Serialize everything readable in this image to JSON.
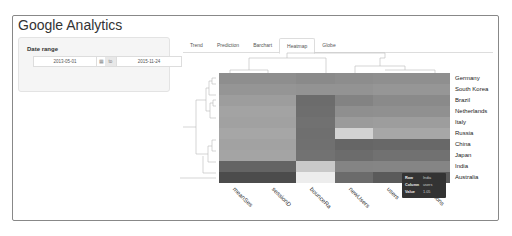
{
  "app": {
    "title": "Google Analytics"
  },
  "sidebar": {
    "date_range_label": "Date range",
    "start_date": "2013-05-01",
    "separator": "to",
    "end_date": "2015-11-24",
    "calendar_icon": "calendar-icon"
  },
  "tabs": [
    {
      "label": "Trend",
      "active": false
    },
    {
      "label": "Prediction",
      "active": false
    },
    {
      "label": "Barchart",
      "active": false
    },
    {
      "label": "Heatmap",
      "active": true
    },
    {
      "label": "Globe",
      "active": false
    }
  ],
  "heatmap": {
    "rows": [
      "Germany",
      "South Korea",
      "Brazil",
      "Netherlands",
      "Italy",
      "Russia",
      "China",
      "Japan",
      "India",
      "Australia"
    ],
    "columns": [
      "meanSessionDuration",
      "sessionDuration",
      "bounceRate",
      "newUsers",
      "users",
      "sessions"
    ],
    "column_labels_visible": [
      "meanSes",
      "sessionD",
      "bounceRa",
      "newUsers",
      "users",
      "sessions"
    ],
    "colors": [
      [
        "#8e8e8e",
        "#8e8e8e",
        "#8a8a8a",
        "#8d8d8d",
        "#8f8f8f",
        "#8f8f8f"
      ],
      [
        "#959595",
        "#959595",
        "#939393",
        "#939393",
        "#969696",
        "#969696"
      ],
      [
        "#9d9d9d",
        "#9d9d9d",
        "#6c6c6c",
        "#838383",
        "#8a8a8a",
        "#8a8a8a"
      ],
      [
        "#a3a3a3",
        "#a3a3a3",
        "#6e6e6e",
        "#8f8f8f",
        "#909090",
        "#909090"
      ],
      [
        "#a1a1a1",
        "#a1a1a1",
        "#717171",
        "#9b9b9b",
        "#9d9d9d",
        "#9d9d9d"
      ],
      [
        "#a6a6a6",
        "#a6a6a6",
        "#6f6f6f",
        "#d3d3d3",
        "#a7a7a7",
        "#a7a7a7"
      ],
      [
        "#a2a2a2",
        "#a2a2a2",
        "#707070",
        "#666666",
        "#686868",
        "#686868"
      ],
      [
        "#a4a4a4",
        "#a4a4a4",
        "#727272",
        "#6c6c6c",
        "#717171",
        "#717171"
      ],
      [
        "#646464",
        "#646464",
        "#c9c9c9",
        "#848484",
        "#858585",
        "#858585"
      ],
      [
        "#4c4c4c",
        "#4c4c4c",
        "#ededed",
        "#6b6b6b",
        "#5a5a5a",
        "#5a5a5a"
      ]
    ]
  },
  "tooltip": {
    "row_key": "Row",
    "row_value": "India",
    "column_key": "Column",
    "column_value": "users",
    "value_key": "Value",
    "value_value": "1.05"
  }
}
